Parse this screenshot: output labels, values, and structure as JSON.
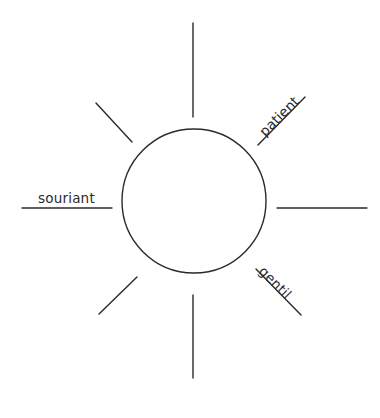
{
  "worksheet": {
    "type": "word-web",
    "background_color": "#ffffff",
    "ink_color": "#2a2a2a",
    "center_bubble": {
      "shape": "circle",
      "label": "",
      "cx": 194,
      "cy": 201,
      "r": 72,
      "stroke_color": "#2a2a2a",
      "fill_color": "#ffffff"
    },
    "rays": [
      {
        "id": "ray-up",
        "position": "top",
        "angle_deg": 270,
        "label": "",
        "filled": false,
        "x1": 193,
        "y1": 117,
        "x2": 193,
        "y2": 23
      },
      {
        "id": "ray-up-right",
        "position": "top-right",
        "angle_deg": 315,
        "label": "patient",
        "filled": true,
        "x1": 258,
        "y1": 145,
        "x2": 305,
        "y2": 97
      },
      {
        "id": "ray-right",
        "position": "right",
        "angle_deg": 0,
        "label": "",
        "filled": false,
        "x1": 277,
        "y1": 208,
        "x2": 367,
        "y2": 208
      },
      {
        "id": "ray-down-right",
        "position": "bottom-right",
        "angle_deg": 45,
        "label": "gentil",
        "filled": true,
        "x1": 256,
        "y1": 269,
        "x2": 301,
        "y2": 315
      },
      {
        "id": "ray-down",
        "position": "bottom",
        "angle_deg": 90,
        "label": "",
        "filled": false,
        "x1": 193,
        "y1": 295,
        "x2": 193,
        "y2": 378
      },
      {
        "id": "ray-down-left",
        "position": "bottom-left",
        "angle_deg": 135,
        "label": "",
        "filled": false,
        "x1": 137,
        "y1": 277,
        "x2": 99,
        "y2": 314
      },
      {
        "id": "ray-left",
        "position": "left",
        "angle_deg": 180,
        "label": "souriant",
        "filled": true,
        "x1": 112,
        "y1": 208,
        "x2": 22,
        "y2": 208
      },
      {
        "id": "ray-up-left",
        "position": "top-left",
        "angle_deg": 225,
        "label": "",
        "filled": false,
        "x1": 132,
        "y1": 142,
        "x2": 96,
        "y2": 103
      }
    ],
    "labels": {
      "left": "souriant",
      "top_right": "patient",
      "bottom_right": "gentil"
    }
  }
}
